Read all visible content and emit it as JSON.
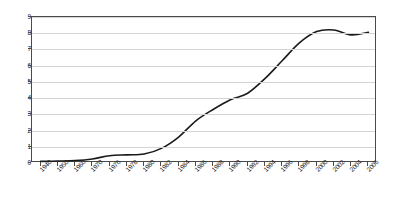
{
  "chart_data": {
    "type": "line",
    "title": "",
    "xlabel": "",
    "ylabel": "",
    "ylim": [
      0,
      9
    ],
    "yticks": [
      0,
      1,
      2,
      3,
      4,
      5,
      6,
      7,
      8,
      9
    ],
    "grid": true,
    "legend": false,
    "legend_position": "none",
    "line_color": "#1a1a1a",
    "grid_color": "#d4d4d4",
    "axis_color": "#4a4a4a",
    "background_color": "#ffffff",
    "categories": [
      "1940",
      "1950",
      "1960",
      "1970",
      "1976",
      "1978",
      "1980",
      "1982",
      "1984",
      "1986",
      "1988",
      "1990",
      "1992",
      "1994",
      "1996",
      "1998",
      "2000",
      "2002",
      "2004",
      "2006"
    ],
    "values": [
      0.1,
      0.12,
      0.15,
      0.25,
      0.45,
      0.5,
      0.55,
      0.9,
      1.6,
      2.6,
      3.3,
      3.9,
      4.3,
      5.2,
      6.3,
      7.4,
      8.1,
      8.2,
      7.9,
      8.05
    ],
    "series": [
      {
        "name": "series-1",
        "values": [
          0.1,
          0.12,
          0.15,
          0.25,
          0.45,
          0.5,
          0.55,
          0.9,
          1.6,
          2.6,
          3.3,
          3.9,
          4.3,
          5.2,
          6.3,
          7.4,
          8.1,
          8.2,
          7.9,
          8.05
        ]
      }
    ]
  }
}
